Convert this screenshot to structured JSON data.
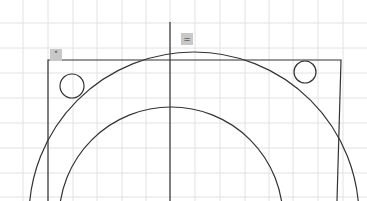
{
  "canvas": {
    "width": 367,
    "height": 201,
    "background": "#ffffff"
  },
  "colors": {
    "grid": "#e2e2e2",
    "stroke": "#333333",
    "marker_bg": "#c8c8c8"
  },
  "grid": {
    "vertical_x": [
      23,
      48,
      73,
      97,
      122,
      146,
      170,
      195,
      220,
      245,
      269,
      293,
      318,
      343
    ],
    "horizontal_y": [
      23,
      48,
      73,
      98,
      123,
      148,
      173,
      197
    ]
  },
  "shapes": {
    "center_line": {
      "x1": 170,
      "y1": 22,
      "x2": 170,
      "y2": 201
    },
    "rectangle": {
      "left": 48,
      "top": 60,
      "right_top": 341,
      "right_bottom": 337,
      "bottom": 201
    },
    "outer_circle": {
      "cx": 194,
      "cy": 217,
      "r": 165
    },
    "inner_circle": {
      "cx": 171,
      "cy": 219,
      "r": 112
    },
    "small_circle_left": {
      "cx": 72,
      "cy": 86,
      "r": 12
    },
    "small_circle_right": {
      "cx": 305,
      "cy": 72,
      "r": 11
    }
  },
  "markers": [
    {
      "id": "corner-marker",
      "x": 56,
      "y": 55,
      "glyph": "˂"
    },
    {
      "id": "midpoint-marker",
      "x": 187,
      "y": 39,
      "glyph": "="
    }
  ]
}
